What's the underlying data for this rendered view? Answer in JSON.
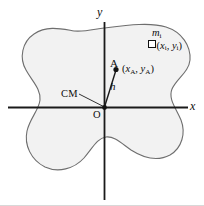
{
  "figure": {
    "name": "rigid-body-parallel-axis-diagram",
    "background_color": "#ffffff",
    "body_fill_color": "#f2f2f2",
    "body_stroke_color": "#6e6e6e",
    "axis_color": "#1a1a1a",
    "text_color": "#0d0d0d"
  },
  "axes": {
    "y_label": "y",
    "x_label": "x",
    "origin_label": "O"
  },
  "annotations": {
    "center_of_mass_label": "CM",
    "point_a_label": "A",
    "point_a_coords": "(x",
    "point_a_coords_full": "(xA, yA)",
    "distance_label": "h",
    "mass_element_label": "mi",
    "mass_element_coords_full": "(xi, yi)",
    "marker_icon": "open-square-marker"
  },
  "coordinate_parts": {
    "a_open": "(",
    "a_x_var": "x",
    "a_x_sub": "A",
    "a_comma": ", ",
    "a_y_var": "y",
    "a_y_sub": "A",
    "a_close": ")",
    "i_open": "(",
    "i_x_var": "x",
    "i_x_sub": "i",
    "i_comma": ", ",
    "i_y_var": "y",
    "i_y_sub": "i",
    "i_close": ")",
    "m_var": "m",
    "m_sub": "i"
  }
}
